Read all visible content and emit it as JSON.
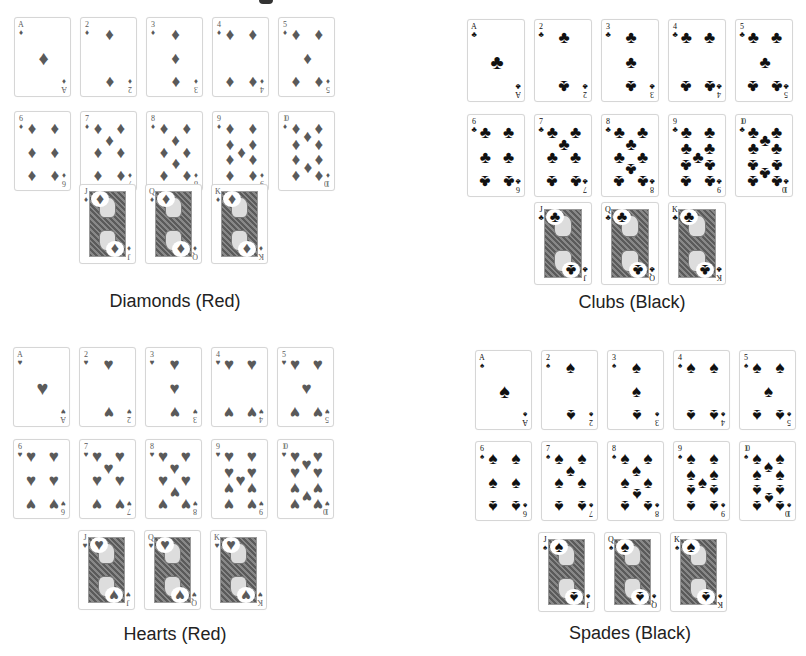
{
  "suits": [
    {
      "id": "diamonds",
      "label": "Diamonds (Red)",
      "symbol": "♦",
      "color_class": "red",
      "color": "#5a5a5a",
      "origin": [
        14,
        17
      ],
      "card_size": [
        57,
        80
      ],
      "col_step": 66,
      "row_step": 94,
      "face_row_top": 184,
      "face_row_left": 79,
      "label_pos": [
        25,
        291
      ],
      "ranks_row1": [
        "A",
        "2",
        "3",
        "4",
        "5"
      ],
      "ranks_row2": [
        "6",
        "7",
        "8",
        "9",
        "10"
      ],
      "faces": [
        "J",
        "Q",
        "K"
      ]
    },
    {
      "id": "clubs",
      "label": "Clubs (Black)",
      "symbol": "♣",
      "color_class": "black",
      "color": "#111111",
      "origin": [
        467,
        19
      ],
      "card_size": [
        58,
        83
      ],
      "col_step": 67,
      "row_step": 95,
      "face_row_top": 202,
      "face_row_left": 534,
      "label_pos": [
        482,
        292
      ],
      "ranks_row1": [
        "A",
        "2",
        "3",
        "4",
        "5"
      ],
      "ranks_row2": [
        "6",
        "7",
        "8",
        "9",
        "10"
      ],
      "faces": [
        "J",
        "Q",
        "K"
      ]
    },
    {
      "id": "hearts",
      "label": "Hearts (Red)",
      "symbol": "♥",
      "color_class": "red",
      "color": "#5a5a5a",
      "origin": [
        13,
        347
      ],
      "card_size": [
        57,
        80
      ],
      "col_step": 66,
      "row_step": 92,
      "face_row_top": 530,
      "face_row_left": 78,
      "label_pos": [
        25,
        624
      ],
      "ranks_row1": [
        "A",
        "2",
        "3",
        "4",
        "5"
      ],
      "ranks_row2": [
        "6",
        "7",
        "8",
        "9",
        "10"
      ],
      "faces": [
        "J",
        "Q",
        "K"
      ]
    },
    {
      "id": "spades",
      "label": "Spades (Black)",
      "symbol": "♠",
      "color_class": "black",
      "color": "#111111",
      "origin": [
        475,
        350
      ],
      "card_size": [
        57,
        80
      ],
      "col_step": 66,
      "row_step": 91,
      "face_row_top": 532,
      "face_row_left": 538,
      "label_pos": [
        480,
        623
      ],
      "ranks_row1": [
        "A",
        "2",
        "3",
        "4",
        "5"
      ],
      "ranks_row2": [
        "6",
        "7",
        "8",
        "9",
        "10"
      ],
      "faces": [
        "J",
        "Q",
        "K"
      ]
    }
  ]
}
